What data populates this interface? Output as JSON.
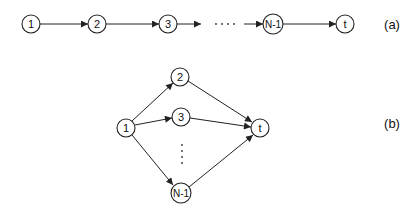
{
  "panels": [
    {
      "id": "a",
      "label": "(a)",
      "layout": "chain",
      "nodes": [
        {
          "id": "1",
          "label": "1",
          "x": 31,
          "y": 24
        },
        {
          "id": "2",
          "label": "2",
          "x": 97,
          "y": 24
        },
        {
          "id": "3",
          "label": "3",
          "x": 168,
          "y": 24
        },
        {
          "id": "N-1",
          "label": "N-1",
          "x": 273,
          "y": 24
        },
        {
          "id": "t",
          "label": "t",
          "x": 345,
          "y": 24
        }
      ],
      "edges": [
        {
          "from": "1",
          "to": "2"
        },
        {
          "from": "2",
          "to": "3"
        },
        {
          "from": "3",
          "to": "ellipsis"
        },
        {
          "from": "ellipsis",
          "to": "N-1"
        },
        {
          "from": "N-1",
          "to": "t"
        }
      ],
      "ellipsis": "····"
    },
    {
      "id": "b",
      "label": "(b)",
      "layout": "parallel",
      "nodes": [
        {
          "id": "1",
          "label": "1",
          "x": 126,
          "y": 128
        },
        {
          "id": "2",
          "label": "2",
          "x": 180,
          "y": 77
        },
        {
          "id": "3",
          "label": "3",
          "x": 181,
          "y": 117
        },
        {
          "id": "N-1",
          "label": "N-1",
          "x": 181,
          "y": 193
        },
        {
          "id": "t",
          "label": "t",
          "x": 260,
          "y": 128
        }
      ],
      "edges": [
        {
          "from": "1",
          "to": "2"
        },
        {
          "from": "1",
          "to": "3"
        },
        {
          "from": "1",
          "to": "N-1"
        },
        {
          "from": "2",
          "to": "t"
        },
        {
          "from": "3",
          "to": "t"
        },
        {
          "from": "N-1",
          "to": "t"
        }
      ],
      "ellipsis": "⋮"
    }
  ],
  "colors": {
    "stroke": "#222222",
    "background": "#ffffff"
  }
}
